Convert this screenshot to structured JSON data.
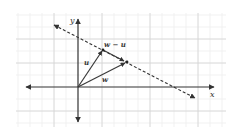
{
  "diagram": {
    "type": "vector-diagram",
    "axes": {
      "x_label": "x",
      "y_label": "y",
      "origin_px": [
        78,
        87
      ]
    },
    "vectors": [
      {
        "id": "u",
        "label": "u",
        "from": [
          78,
          87
        ],
        "to": [
          103,
          50
        ]
      },
      {
        "id": "w",
        "label": "w",
        "from": [
          78,
          87
        ],
        "to": [
          126,
          62
        ]
      },
      {
        "id": "w-minus-u",
        "label": "w − u",
        "from": [
          103,
          50
        ],
        "to": [
          126,
          62
        ]
      }
    ],
    "dashed_line": {
      "from": [
        54,
        25
      ],
      "to": [
        195,
        98
      ],
      "style": "dashed",
      "arrows": "both"
    },
    "colors": {
      "grid_minor": "#eeeeee",
      "grid_major": "#d4d4d4",
      "axis": "#333333",
      "vector": "#3a3a3a",
      "label": "#333333"
    }
  }
}
